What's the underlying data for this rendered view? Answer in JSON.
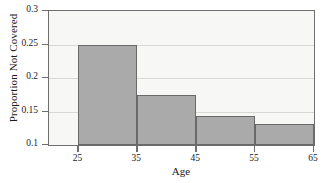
{
  "chart_data": {
    "type": "bar",
    "title": "",
    "subtitle": "",
    "xlabel": "Age",
    "ylabel": "Proportion Not Covered",
    "categories": [
      "25-35",
      "35-45",
      "45-55",
      "55-65"
    ],
    "bin_edges": [
      25,
      35,
      45,
      55,
      65
    ],
    "values": [
      0.25,
      0.175,
      0.144,
      0.132
    ],
    "xlim": [
      20,
      65
    ],
    "ylim": [
      0.1,
      0.3
    ],
    "x_ticks": [
      25,
      35,
      45,
      55,
      65
    ],
    "x_tick_labels": [
      "25",
      "35",
      "45",
      "55",
      "65"
    ],
    "y_ticks": [
      0.1,
      0.15,
      0.2,
      0.25,
      0.3
    ],
    "y_tick_labels": [
      "0.1",
      "0.15",
      "0.2",
      "0.25",
      "0.3"
    ],
    "grid": true,
    "grid_axis": "y",
    "legend": false,
    "legend_position": "none",
    "bar_color": "#aaaaaa",
    "bar_edge_color": "#6a6a6a",
    "plot_background": "#f7f7f5",
    "grid_color": "#d8d8d4",
    "axis_color": "#6e6e6e",
    "text_color": "#1a1a1a",
    "annotations": []
  }
}
